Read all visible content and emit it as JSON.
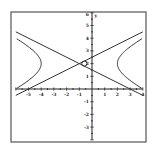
{
  "chart_data": {
    "type": "line",
    "title": "",
    "xlabel": "",
    "ylabel": "y",
    "xlim": [
      -6,
      4
    ],
    "ylim": [
      -4,
      6
    ],
    "grid": false,
    "x_ticks": [
      "-5",
      "-4",
      "-3",
      "-2",
      "-1",
      "1",
      "2",
      "3",
      "4"
    ],
    "y_ticks": [
      "5",
      "4",
      "3",
      "2",
      "1",
      "-1",
      "-2",
      "-3"
    ],
    "y_top_label": "6",
    "series": [
      {
        "name": "hyperbola",
        "equation": "(x+1)^2/9 - (y-2)^2/2.25 = 1",
        "center": [
          -1,
          2
        ],
        "vertices": [
          [
            -4,
            2
          ],
          [
            2,
            2
          ]
        ]
      },
      {
        "name": "asymptote-1",
        "equation": "y = 2 + 0.5(x+1)"
      },
      {
        "name": "asymptote-2",
        "equation": "y = 2 - 0.5(x+1)"
      }
    ]
  }
}
